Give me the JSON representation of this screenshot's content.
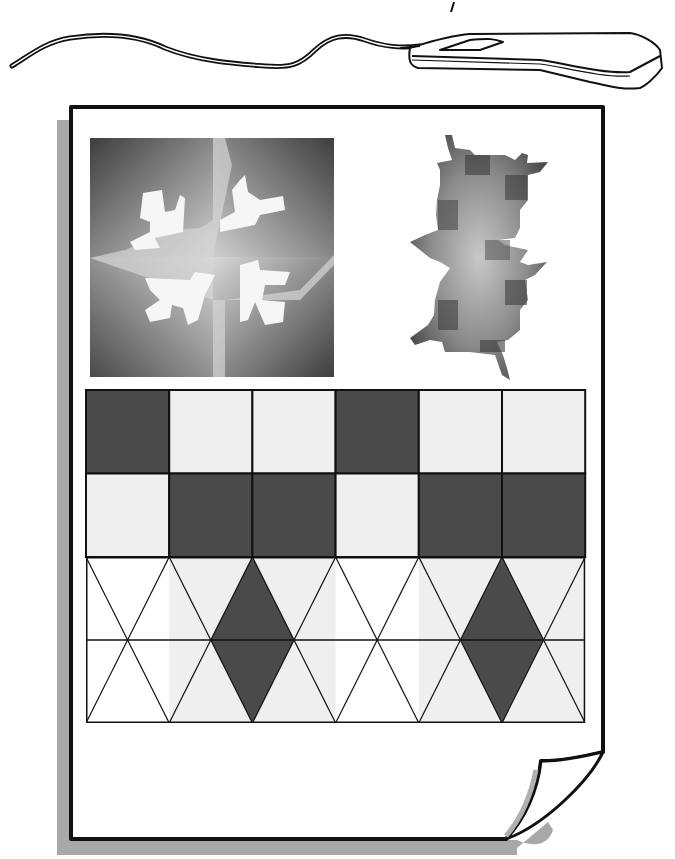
{
  "illustration": {
    "description": "Clip-art of a computer mouse connected by cable above a printed page showing tessellation artwork",
    "colors": {
      "ink": "#111111",
      "dark_fill": "#4a4a4a",
      "light_fill": "#efefef",
      "white_fill": "#ffffff",
      "shadow": "#a8a8a8"
    },
    "square_grid": {
      "rows": [
        [
          "dark",
          "light",
          "light",
          "dark",
          "light",
          "light"
        ],
        [
          "light",
          "dark",
          "dark",
          "light",
          "dark",
          "dark"
        ]
      ]
    },
    "triangle_band": {
      "columns": 6,
      "rows": 2,
      "dark_diamond_columns": [
        2,
        5
      ],
      "light_triangle_columns": [
        1,
        2,
        4,
        5
      ]
    }
  }
}
